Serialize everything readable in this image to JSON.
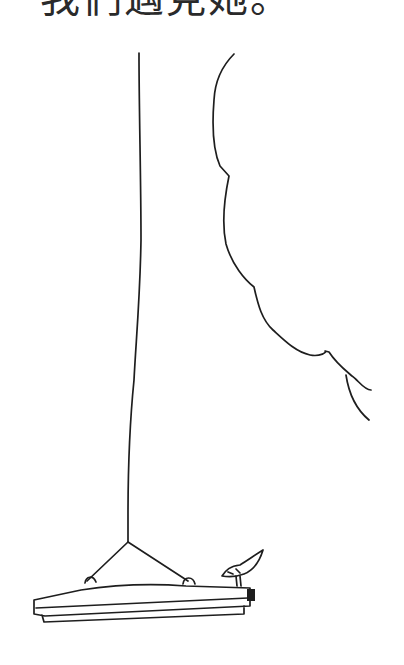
{
  "page": {
    "caption": "我們遇見她。"
  },
  "illustration": {
    "elements": [
      "rope",
      "tree-foliage-outline",
      "swing-seat",
      "bird"
    ],
    "ink_color": "#1e1e1e",
    "background_color": "#ffffff"
  }
}
